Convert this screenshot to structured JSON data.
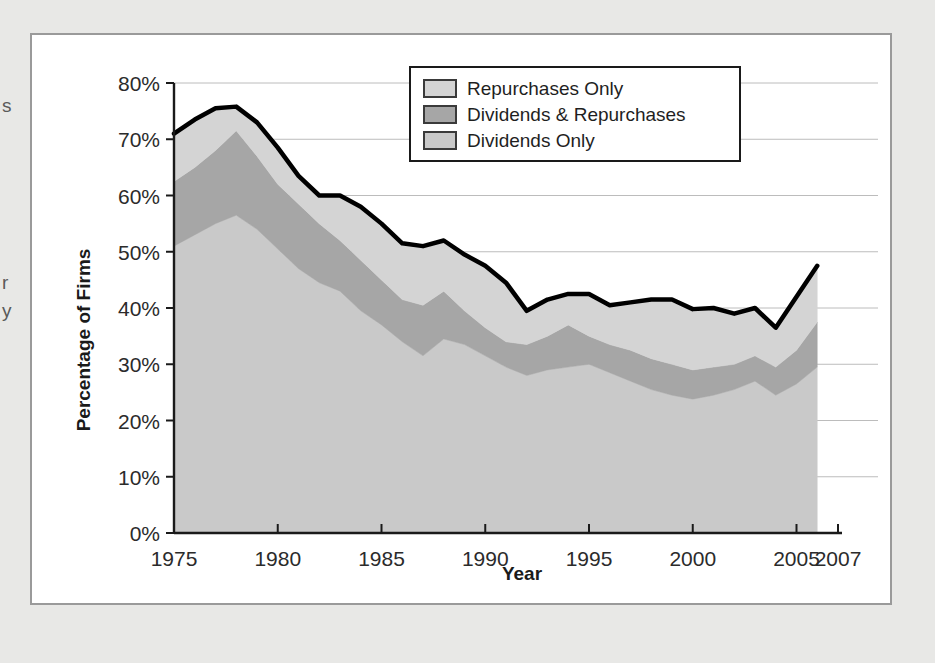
{
  "page": {
    "background_color": "#e8e8e6",
    "panel_background": "#ffffff",
    "panel_border_color": "#9a9a9a",
    "edge_fragments": [
      {
        "name": "fragment-s",
        "text": "s"
      },
      {
        "name": "fragment-r",
        "text": "r"
      },
      {
        "name": "fragment-y",
        "text": "y"
      }
    ]
  },
  "chart_data": {
    "type": "area",
    "stacked": true,
    "title": "",
    "subtitle": "",
    "xlabel": "Year",
    "ylabel": "Percentage of Firms",
    "xlim": [
      1975,
      2007
    ],
    "ylim": [
      0,
      80
    ],
    "grid": true,
    "grid_orientation": "horizontal",
    "legend_position": "top-right",
    "x_tick_labels": [
      "1975",
      "1980",
      "1985",
      "1990",
      "1995",
      "2000",
      "2005",
      "2007"
    ],
    "x_tick_values": [
      1975,
      1980,
      1985,
      1990,
      1995,
      2000,
      2005,
      2007
    ],
    "y_tick_labels": [
      "0%",
      "10%",
      "20%",
      "30%",
      "40%",
      "50%",
      "60%",
      "70%",
      "80%"
    ],
    "y_tick_values": [
      0,
      10,
      20,
      30,
      40,
      50,
      60,
      70,
      80
    ],
    "x": [
      1975,
      1976,
      1977,
      1978,
      1979,
      1980,
      1981,
      1982,
      1983,
      1984,
      1985,
      1986,
      1987,
      1988,
      1989,
      1990,
      1991,
      1992,
      1993,
      1994,
      1995,
      1996,
      1997,
      1998,
      1999,
      2000,
      2001,
      2002,
      2003,
      2004,
      2005,
      2006
    ],
    "series": [
      {
        "name": "Dividends Only",
        "color": "#c9c9c9",
        "values": [
          51.0,
          53.0,
          55.0,
          56.5,
          54.0,
          50.5,
          47.0,
          44.5,
          43.0,
          39.5,
          37.0,
          34.0,
          31.5,
          34.5,
          33.5,
          31.5,
          29.5,
          28.0,
          29.0,
          29.5,
          30.0,
          28.5,
          27.0,
          25.5,
          24.5,
          23.8,
          24.5,
          25.5,
          27.0,
          24.5,
          26.5,
          29.5
        ]
      },
      {
        "name": "Dividends & Repurchases",
        "color": "#a6a6a6",
        "values": [
          11.5,
          12.0,
          13.0,
          15.0,
          13.0,
          11.5,
          11.5,
          10.5,
          9.0,
          9.0,
          8.0,
          7.5,
          9.0,
          8.5,
          6.0,
          5.0,
          4.5,
          5.5,
          6.0,
          7.5,
          5.0,
          5.0,
          5.5,
          5.5,
          5.5,
          5.2,
          5.0,
          4.5,
          4.5,
          5.0,
          6.0,
          8.0
        ]
      },
      {
        "name": "Repurchases Only",
        "color": "#d4d4d4",
        "values": [
          8.5,
          8.5,
          7.5,
          4.3,
          6.0,
          6.5,
          5.0,
          5.0,
          8.0,
          9.5,
          10.0,
          10.0,
          10.5,
          9.0,
          10.0,
          11.0,
          10.5,
          6.0,
          6.5,
          5.5,
          7.5,
          7.0,
          8.5,
          10.5,
          11.5,
          10.8,
          10.5,
          9.0,
          8.5,
          7.0,
          9.5,
          10.0
        ]
      }
    ],
    "total_line": {
      "name": "Total",
      "color": "#000000",
      "values": [
        71.0,
        73.5,
        75.5,
        75.8,
        73.0,
        68.5,
        63.5,
        60.0,
        60.0,
        58.0,
        55.0,
        51.5,
        51.0,
        52.0,
        49.5,
        47.5,
        44.5,
        39.5,
        41.5,
        42.5,
        42.5,
        40.5,
        41.0,
        41.5,
        41.5,
        39.8,
        40.0,
        39.0,
        40.0,
        36.5,
        42.0,
        47.5
      ]
    },
    "legend": [
      {
        "label": "Repurchases Only",
        "color": "#d4d4d4"
      },
      {
        "label": "Dividends & Repurchases",
        "color": "#a6a6a6"
      },
      {
        "label": "Dividends Only",
        "color": "#c9c9c9"
      }
    ]
  }
}
